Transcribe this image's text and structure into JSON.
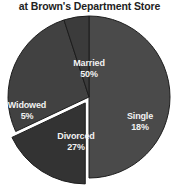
{
  "chart_data": {
    "type": "pie",
    "title": "at Brown's Department Store",
    "xlabel": "",
    "ylabel": "",
    "legend": "none",
    "grid": false,
    "note": "Title is clipped at the top of the screenshot; only the second line is visible.",
    "categories": [
      "Married",
      "Single",
      "Divorced",
      "Widowed"
    ],
    "values": [
      50,
      18,
      27,
      5
    ],
    "unit": "%",
    "slices": [
      {
        "label": "Married",
        "value": 50,
        "display_value": "50%",
        "color": "#4a4a4a",
        "exploded": false,
        "start_angle_deg": 0,
        "end_angle_deg": 180
      },
      {
        "label": "Single",
        "value": 18,
        "display_value": "18%",
        "color": "#333333",
        "exploded": true,
        "start_angle_deg": 180,
        "end_angle_deg": 244.8
      },
      {
        "label": "Divorced",
        "value": 27,
        "display_value": "27%",
        "color": "#414141",
        "exploded": false,
        "start_angle_deg": 244.8,
        "end_angle_deg": 342
      },
      {
        "label": "Widowed",
        "value": 5,
        "display_value": "5%",
        "color": "#3b3b3b",
        "exploded": false,
        "start_angle_deg": 342,
        "end_angle_deg": 360
      }
    ],
    "colors": {
      "married": "#4a4a4a",
      "single": "#333333",
      "divorced": "#414141",
      "widowed": "#3b3b3b",
      "label_text": "#f2f2f2",
      "title_text": "#222222",
      "background": "#ffffff",
      "slice_border": "#1c1c1c"
    },
    "geometry": {
      "center_x": 89,
      "center_y": 97,
      "radius": 81,
      "explode_offset_px": 7
    }
  }
}
